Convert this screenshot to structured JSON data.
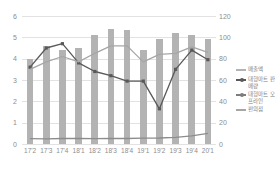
{
  "chart_data": {
    "type": "bar",
    "title": "",
    "xlabel": "",
    "ylabel": "",
    "grid": true,
    "legend_position": "right",
    "categories": [
      "17'2",
      "17'3",
      "17'4",
      "18'1",
      "18'2",
      "18'3",
      "18'4",
      "19'1",
      "19'2",
      "19'3",
      "19'4",
      "20'1"
    ],
    "axes": {
      "left": {
        "min": 0,
        "max": 6,
        "ticks": [
          "0",
          "1",
          "2",
          "3",
          "4",
          "5",
          "6"
        ]
      },
      "right": {
        "min": 0,
        "max": 120,
        "ticks": [
          "0",
          "20",
          "40",
          "60",
          "80",
          "100",
          "120"
        ]
      }
    },
    "series": [
      {
        "name": "매출액",
        "type": "bar",
        "axis": "left",
        "color": "#b3b3b3",
        "values": [
          4.0,
          4.6,
          4.4,
          4.5,
          5.1,
          5.4,
          5.35,
          4.4,
          4.9,
          5.2,
          5.1,
          4.9
        ]
      },
      {
        "name": "대형마트 판매량",
        "type": "line",
        "axis": "right",
        "color": "#595959",
        "values": [
          72,
          90,
          94,
          76,
          68,
          64,
          59,
          59,
          33,
          70,
          88,
          79
        ]
      },
      {
        "name": "대형마트 오프라인",
        "type": "line",
        "axis": "right",
        "color": "#a6a6a6",
        "values": [
          70,
          77,
          82,
          77,
          85,
          92,
          92,
          77,
          84,
          85,
          91,
          86
        ]
      },
      {
        "name": "편의점",
        "type": "line",
        "axis": "left",
        "color": "#8c8c8c",
        "values": [
          0.25,
          0.24,
          0.26,
          0.26,
          0.25,
          0.26,
          0.26,
          0.27,
          0.28,
          0.31,
          0.38,
          0.5
        ]
      }
    ]
  },
  "legend": {
    "items": [
      {
        "label": "매출액",
        "color": "#b3b3b3",
        "marker": false
      },
      {
        "label": "대형마트 판매량",
        "color": "#595959",
        "marker": true
      },
      {
        "label": "대형마트 오프라인",
        "color": "#7d7d7d",
        "marker": true
      },
      {
        "label": "편의점",
        "color": "#a6a6a6",
        "marker": false
      }
    ]
  }
}
